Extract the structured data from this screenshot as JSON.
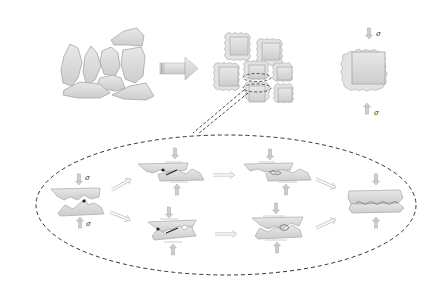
{
  "figure": {
    "type": "schematic diagram",
    "colors": {
      "background": "#ffffff",
      "shape_fill": "#d9d9d9",
      "shape_stroke": "#a8a8a8",
      "grain_core_fill": "#d3d3d3",
      "coating_fill": "#e6e6e6",
      "arrow_fill": "#cfcfcf",
      "dashed_line": "#333333",
      "contact_point": "#222222",
      "crack_line": "#222222"
    },
    "top_row": {
      "loose_particles": {
        "label": "irregular particles",
        "count": 8
      },
      "process_arrow": {
        "icon": "block-right-arrow-icon"
      },
      "packed_grains": {
        "label": "coated grains",
        "count": 7
      },
      "single_grain": {
        "label": "single coated grain under load",
        "stress_top": "σ",
        "stress_bottom": "σ"
      }
    },
    "zoom_ellipse": {
      "style": "dashed",
      "stages": [
        {
          "id": "initial-contact",
          "stress_top": "σ",
          "stress_bottom": "σ"
        },
        {
          "id": "upper-shear-stage-1"
        },
        {
          "id": "upper-shear-stage-2"
        },
        {
          "id": "lower-compression-stage-1"
        },
        {
          "id": "lower-compression-stage-2"
        },
        {
          "id": "final-bonded-interface"
        }
      ],
      "transition_arrows": 6
    }
  }
}
